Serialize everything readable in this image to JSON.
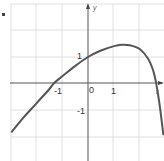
{
  "chart_data": {
    "type": "line",
    "title": "",
    "xlabel": "x",
    "ylabel": "y",
    "xlim": [
      -3,
      2.9
    ],
    "ylim": [
      -2.9,
      3.0
    ],
    "grid": true,
    "tick_labels": {
      "x": [
        "-1",
        "0",
        "1"
      ],
      "y": [
        "1",
        "-1"
      ]
    },
    "series": [
      {
        "name": "f(x)",
        "x": [
          -2.95,
          -2.5,
          -2.0,
          -1.5,
          -1.3,
          -1.0,
          -0.5,
          0,
          0.5,
          1.0,
          1.3,
          1.6,
          2.0,
          2.3,
          2.5,
          2.6,
          2.75,
          2.9
        ],
        "values": [
          -1.9,
          -1.35,
          -0.8,
          -0.25,
          0,
          0.25,
          0.65,
          1.0,
          1.25,
          1.42,
          1.47,
          1.45,
          1.3,
          0.95,
          0.5,
          0.1,
          -0.8,
          -2.0
        ]
      }
    ],
    "color": "#555555"
  },
  "labels": {
    "one_y": "1",
    "neg_one_y": "-1",
    "neg_one_x": "-1",
    "zero": "0",
    "one_x": "1",
    "y_axis": "y",
    "x_axis": "r"
  }
}
